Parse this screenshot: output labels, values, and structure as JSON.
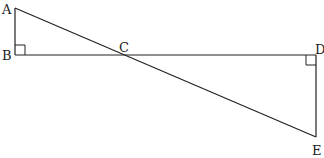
{
  "diagram": {
    "type": "geometry",
    "points": {
      "A": {
        "label": "A",
        "x": 15,
        "y": 8
      },
      "B": {
        "label": "B",
        "x": 15,
        "y": 55
      },
      "C": {
        "label": "C",
        "x": 124,
        "y": 55
      },
      "D": {
        "label": "D",
        "x": 316,
        "y": 55
      },
      "E": {
        "label": "E",
        "x": 316,
        "y": 137
      }
    },
    "segments": [
      {
        "from": "A",
        "to": "B"
      },
      {
        "from": "B",
        "to": "D"
      },
      {
        "from": "D",
        "to": "E"
      },
      {
        "from": "A",
        "to": "E"
      }
    ],
    "right_angles": [
      {
        "vertex": "B"
      },
      {
        "vertex": "D"
      }
    ],
    "stroke_color": "#222222",
    "background": "#ffffff"
  }
}
